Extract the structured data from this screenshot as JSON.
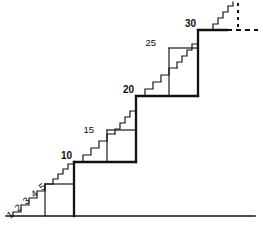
{
  "figure": {
    "stroke_color": "#111111",
    "background_color": "#ffffff",
    "label_color": "#0d0d0d",
    "canvas": {
      "width": 263,
      "height": 229
    }
  },
  "labels": {
    "minor": [
      {
        "text": "1",
        "x": 10,
        "y": 218
      },
      {
        "text": "2",
        "x": 17,
        "y": 211
      },
      {
        "text": "3",
        "x": 25,
        "y": 204
      },
      {
        "text": "4",
        "x": 33,
        "y": 197
      },
      {
        "text": "5",
        "x": 41,
        "y": 190
      }
    ],
    "mid": [
      {
        "text": "15",
        "x": 95,
        "y": 126
      },
      {
        "text": "25",
        "x": 155,
        "y": 44
      }
    ],
    "major": [
      {
        "text": "10",
        "x": 56,
        "y": 160
      },
      {
        "text": "20",
        "x": 116,
        "y": 93
      },
      {
        "text": "30",
        "x": 177,
        "y": 26
      }
    ]
  },
  "geometry": {
    "baseline": {
      "x1": 6,
      "y1": 216,
      "x2": 255,
      "y2": 216
    },
    "stairs_level1": "M 13,216 L 13,212 L 21,212 L 21,205 L 29,205 L 29,198 L 37,198 L 37,191 L 45,191 L 45,184 L 53,184",
    "block1": "M 45,216 L 45,184 L 74,184",
    "riser1": "M 74,216 L 74,162",
    "stairs_level2_a": "M 53,184 L 53,180 L 58,180 L 58,175 L 63,175 L 63,170 L 68,170 L 68,165 L 74,165 L 74,162",
    "stairs_level2": "M 74,162 L 83,162 L 83,155 L 91,155 L 91,148 L 99,148 L 99,141 L 107,141 L 107,134 L 115,134",
    "block2": "M 107,162 L 107,130 L 136,130",
    "riser2": "M 136,162 L 136,96",
    "stairs_level3_a": "M 115,134 L 115,129 L 120,129 L 120,124 L 125,124 L 125,118 L 130,118 L 130,112 L 136,112 L 136,96",
    "stairs_level3": "M 136,96 L 145,96 L 145,89 L 153,89 L 153,82 L 161,82 L 161,75 L 169,75 L 169,68 L 177,68",
    "block3": "M 169,96 L 169,48 L 198,48",
    "riser3": "M 198,96 L 198,30",
    "stairs_level4_a": "M 177,68 L 177,62 L 182,62 L 182,56 L 187,56 L 187,50 L 192,50 L 192,44 L 198,44 L 198,30",
    "top_plateau": "M 198,30 L 226,30",
    "stairs_top": "M 214,30 L 214,24 L 219,24 L 219,18 L 224,18 L 224,12 L 229,12 L 229,6 L 234,6 L 234,2",
    "dashed_vertical": {
      "x": 238,
      "y1": 3,
      "y2": 30,
      "dash": "3,4"
    },
    "dashed_horizontal": {
      "y": 30,
      "x1": 226,
      "x2": 258,
      "dash": "5,4"
    }
  }
}
